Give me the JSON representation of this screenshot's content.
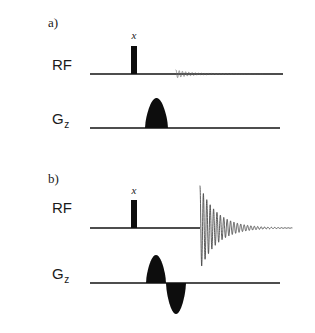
{
  "figure": {
    "width": 315,
    "height": 333,
    "background": "#ffffff",
    "ink": "#0d0d0d",
    "line_color": "#4d4d4d",
    "trace_color": "#404040"
  },
  "panels": [
    {
      "id": "panel-a",
      "label": "a)",
      "label_x": 48,
      "label_y": 27,
      "channels": [
        {
          "id": "rf",
          "name": "RF",
          "subscript": "",
          "label_x": 52,
          "label_y": 70,
          "baseline_y": 74,
          "baseline_x0": 90,
          "baseline_x1": 283,
          "pulse": {
            "phase": "x",
            "phase_x": 134,
            "phase_y": 39,
            "x": 131,
            "width": 6,
            "height": 28
          },
          "fid": {
            "start_x": 176,
            "end_x": 262,
            "amplitude": 4.0,
            "decay": 0.06,
            "frequency": 1.35,
            "visible": true
          }
        },
        {
          "id": "gz",
          "name": "G",
          "subscript": "z",
          "label_x": 52,
          "label_y": 124,
          "baseline_y": 128,
          "baseline_x0": 90,
          "baseline_x1": 280,
          "lobes": [
            {
              "polarity": "positive",
              "x0": 145,
              "x1": 168,
              "height": 30
            }
          ],
          "fid": {
            "visible": false
          }
        }
      ]
    },
    {
      "id": "panel-b",
      "label": "b)",
      "label_x": 48,
      "label_y": 183,
      "channels": [
        {
          "id": "rf",
          "name": "RF",
          "subscript": "",
          "label_x": 52,
          "label_y": 213,
          "baseline_y": 228,
          "baseline_x0": 90,
          "baseline_x1": 200,
          "pulse": {
            "phase": "x",
            "phase_x": 134,
            "phase_y": 194,
            "x": 131,
            "width": 6,
            "height": 28
          },
          "fid": {
            "start_x": 200,
            "end_x": 292,
            "amplitude": 42.0,
            "decay": 0.058,
            "frequency": 1.28,
            "visible": true
          }
        },
        {
          "id": "gz",
          "name": "G",
          "subscript": "z",
          "label_x": 52,
          "label_y": 279,
          "baseline_y": 283,
          "baseline_x0": 90,
          "baseline_x1": 280,
          "lobes": [
            {
              "polarity": "positive",
              "x0": 146,
              "x1": 166,
              "height": 28
            },
            {
              "polarity": "negative",
              "x0": 166,
              "x1": 186,
              "height": 31
            }
          ],
          "fid": {
            "visible": false
          }
        }
      ]
    }
  ],
  "sequence_data": {
    "type": "pulse-sequence",
    "description": "NMR/MRI pulse sequence timing diagram with two variants",
    "channel_names": [
      "RF",
      "Gz"
    ],
    "panel_labels": [
      "a)",
      "b)"
    ],
    "pulse_phase_labels": [
      "x",
      "x"
    ],
    "panel_a_summary": "Hard 90-degree x pulse on RF followed by a weak rapidly decaying FID; single positive slice-select gradient lobe on Gz",
    "panel_b_summary": "Hard 90-degree x pulse on RF followed by a large slowly decaying FID; bipolar gradient (positive lobe then negative refocusing lobe) on Gz"
  }
}
